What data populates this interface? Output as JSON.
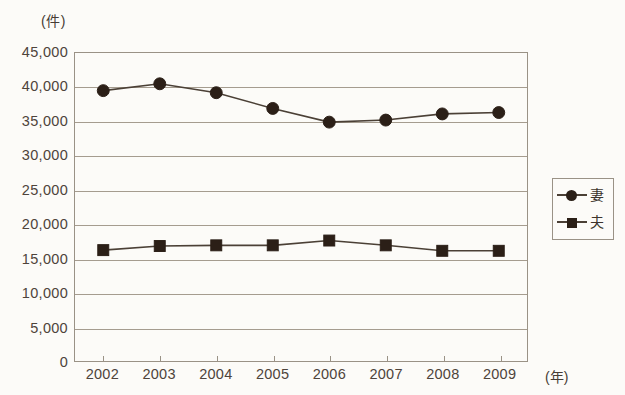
{
  "chart_data": {
    "type": "line",
    "title": "",
    "xlabel": "(年)",
    "ylabel": "(件)",
    "x": [
      "2002",
      "2003",
      "2004",
      "2005",
      "2006",
      "2007",
      "2008",
      "2009"
    ],
    "categories": [
      "2002",
      "2003",
      "2004",
      "2005",
      "2006",
      "2007",
      "2008",
      "2009"
    ],
    "series": [
      {
        "name": "妻",
        "marker": "circle",
        "color": "#2b1f17",
        "values": [
          39500,
          40500,
          39200,
          36900,
          34900,
          35200,
          36100,
          36300
        ]
      },
      {
        "name": "夫",
        "marker": "square",
        "color": "#2b1f17",
        "values": [
          16200,
          16800,
          16900,
          16900,
          17600,
          16900,
          16100,
          16100
        ]
      }
    ],
    "ylim": [
      0,
      45000
    ],
    "ytick_values": [
      45000,
      40000,
      35000,
      30000,
      25000,
      20000,
      15000,
      10000,
      5000,
      0
    ],
    "ytick_labels": [
      "45,000",
      "40,000",
      "35,000",
      "30,000",
      "25,000",
      "20,000",
      "15,000",
      "10,000",
      "5,000",
      "0"
    ],
    "grid": true,
    "grid_axis": "y",
    "legend_position": "right",
    "legend_entries": [
      "妻",
      "夫"
    ],
    "line_color": "#4b4036",
    "grid_color": "#a59c8f",
    "frame_color": "#9a9286",
    "background_color": "#fcfbf8"
  }
}
